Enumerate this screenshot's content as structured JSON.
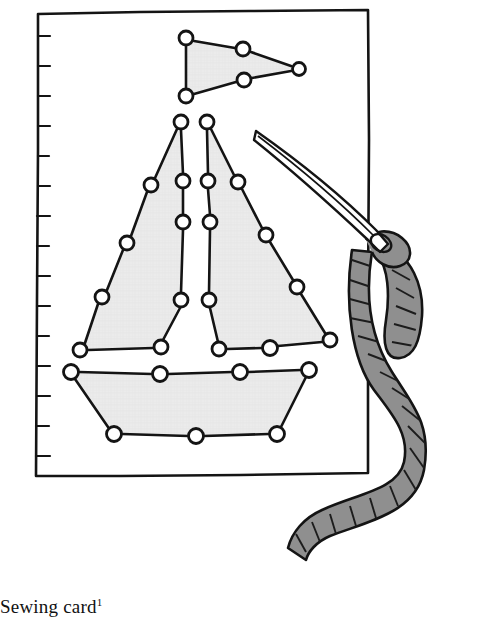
{
  "figure": {
    "caption_text": "Sewing card",
    "caption_footnote": "1",
    "colors": {
      "ink": "#141414",
      "paper": "#ffffff",
      "shape_fill": "#ebebeb",
      "yarn_fill": "#8f8f8f",
      "yarn_shadow": "#6e6e6e",
      "needle_fill": "#ffffff"
    }
  },
  "card": {
    "label": "sewing card",
    "corners": [
      [
        38,
        14
      ],
      [
        368,
        10
      ],
      [
        368,
        473
      ],
      [
        36,
        476
      ]
    ],
    "ruled_edge": {
      "label": "perforated left edge",
      "tick_count": 15,
      "tick_length": 12,
      "x": 38,
      "y_start": 30,
      "y_end": 466
    }
  },
  "boat": {
    "label": "dot-to-dot sailboat",
    "parts": [
      {
        "name": "flag",
        "label": "pennant flag",
        "outline": [
          [
            186,
            38
          ],
          [
            243,
            49
          ],
          [
            299,
            69
          ],
          [
            244,
            80
          ],
          [
            186,
            96
          ]
        ],
        "dots": [
          [
            186,
            38
          ],
          [
            243,
            49
          ],
          [
            299,
            69
          ],
          [
            244,
            80
          ],
          [
            186,
            96
          ]
        ]
      },
      {
        "name": "left-sail",
        "label": "left sail",
        "outline": [
          [
            181,
            122
          ],
          [
            151,
            185
          ],
          [
            127,
            243
          ],
          [
            102,
            297
          ],
          [
            80,
            350
          ],
          [
            161,
            347
          ],
          [
            181,
            300
          ],
          [
            183,
            222
          ],
          [
            183,
            181
          ]
        ],
        "edge_dots": [
          [
            151,
            185
          ],
          [
            127,
            243
          ],
          [
            102,
            297
          ]
        ],
        "apex_dot": [
          181,
          122
        ],
        "foot_dots": [
          [
            80,
            350
          ],
          [
            161,
            347
          ]
        ],
        "mast_dots": [
          [
            181,
            122
          ],
          [
            183,
            181
          ],
          [
            183,
            222
          ],
          [
            181,
            300
          ],
          [
            161,
            347
          ]
        ]
      },
      {
        "name": "right-sail",
        "label": "right sail",
        "outline": [
          [
            207,
            122
          ],
          [
            238,
            182
          ],
          [
            266,
            235
          ],
          [
            297,
            287
          ],
          [
            330,
            340
          ],
          [
            270,
            348
          ],
          [
            219,
            349
          ],
          [
            209,
            300
          ],
          [
            210,
            222
          ],
          [
            208,
            181
          ]
        ],
        "edge_dots": [
          [
            238,
            182
          ],
          [
            266,
            235
          ],
          [
            297,
            287
          ]
        ],
        "apex_dot": [
          207,
          122
        ],
        "foot_dots": [
          [
            330,
            340
          ],
          [
            270,
            348
          ],
          [
            219,
            349
          ]
        ],
        "mast_dots": [
          [
            207,
            122
          ],
          [
            208,
            181
          ],
          [
            210,
            222
          ],
          [
            209,
            300
          ],
          [
            219,
            349
          ]
        ]
      },
      {
        "name": "hull",
        "label": "boat hull",
        "outline": [
          [
            71,
            372
          ],
          [
            160,
            374
          ],
          [
            240,
            372
          ],
          [
            309,
            370
          ],
          [
            277,
            434
          ],
          [
            196,
            436
          ],
          [
            114,
            434
          ]
        ],
        "dots": [
          [
            71,
            372
          ],
          [
            160,
            374
          ],
          [
            240,
            372
          ],
          [
            309,
            370
          ],
          [
            277,
            434
          ],
          [
            196,
            436
          ],
          [
            114,
            434
          ]
        ]
      }
    ],
    "dot_radius": 7,
    "dot_count": 32
  },
  "needle": {
    "label": "sewing needle",
    "tip": [
      256,
      131
    ],
    "eye": [
      381,
      243
    ],
    "eye_radius": 9
  },
  "yarn": {
    "label": "gray yarn thread",
    "strands": [
      {
        "name": "loop-through-eye",
        "label": "yarn loop through needle eye"
      },
      {
        "name": "short-tail",
        "label": "short hanging tail",
        "end": [
          420,
          351
        ]
      },
      {
        "name": "long-strand",
        "label": "long trailing strand",
        "end": [
          308,
          560
        ]
      }
    ],
    "twist_marks": 34
  }
}
